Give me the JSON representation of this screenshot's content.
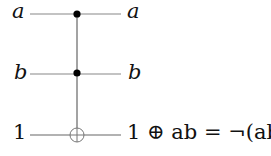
{
  "diagram": {
    "type": "reversible-logic-circuit (Toffoli / CCNOT gate)",
    "inputs": [
      {
        "label": "a",
        "italic": true
      },
      {
        "label": "b",
        "italic": true
      },
      {
        "label": "1",
        "italic": false
      }
    ],
    "outputs": [
      {
        "label": "a",
        "italic": true
      },
      {
        "label": "b",
        "italic": true
      },
      {
        "label": "1 ⊕ ab = ¬(ab)",
        "italic": false
      }
    ],
    "gate": {
      "controls": [
        "a",
        "b"
      ],
      "target": "1",
      "control_symbol": "filled-dot",
      "target_symbol": "oplus"
    },
    "colors": {
      "wire": "#777777",
      "dot": "#000000",
      "text": "#111111"
    }
  }
}
